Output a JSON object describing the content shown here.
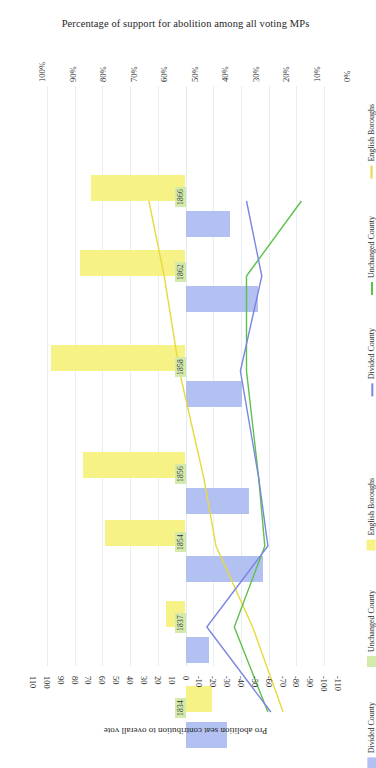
{
  "chart_data": {
    "type": "bar",
    "title": "Percentage of support for abolition among all voting MPs",
    "xlabel": "Pro abolition seat contribution to overall vote",
    "ylabel": "",
    "orientation": "rotated-90",
    "grid": true,
    "top_axis": {
      "label": "Percentage of support for abolition among all voting MPs",
      "ticks": [
        "100%",
        "90%",
        "80%",
        "70%",
        "60%",
        "50%",
        "40%",
        "30%",
        "20%",
        "10%",
        "0%"
      ],
      "range": [
        100,
        0
      ]
    },
    "bottom_axis": {
      "label": "Pro abolition seat contribution to overall vote",
      "ticks": [
        "110",
        "100",
        "90",
        "80",
        "70",
        "60",
        "50",
        "40",
        "30",
        "20",
        "10",
        "0",
        "-10",
        "-20",
        "-30",
        "-40",
        "-50",
        "-60",
        "-70",
        "-80",
        "-90",
        "-100",
        "-110"
      ],
      "range": [
        110,
        -110
      ]
    },
    "categories": [
      "1866",
      "1862",
      "1858",
      "1856",
      "1854",
      "1837",
      "1834"
    ],
    "bar_series": [
      {
        "name": "English Boroughs",
        "color": "#f6f285",
        "values": [
          68,
          76,
          97,
          74,
          58,
          14,
          -19
        ]
      },
      {
        "name": "Unchanged County",
        "color": "#d2ebab",
        "values": [
          5,
          4,
          3,
          6,
          7,
          9,
          2
        ]
      },
      {
        "name": "Divided County",
        "color": "#b2c0f2",
        "values": [
          -32,
          -52,
          -41,
          -46,
          -56,
          -17,
          -30
        ]
      }
    ],
    "line_series": [
      {
        "name": "English Boroughs",
        "color": "#e8d93f",
        "values": [
          62,
          57,
          52,
          44,
          40,
          28,
          18
        ]
      },
      {
        "name": "Unchanged County",
        "color": "#5cc14a",
        "values": [
          12,
          30,
          30,
          26,
          24,
          34,
          23
        ]
      },
      {
        "name": "Divided County",
        "color": "#7b86e0",
        "values": [
          30,
          25,
          32,
          26,
          23,
          43,
          22
        ]
      }
    ],
    "legend_position": "right",
    "legend_groups": [
      {
        "kind": "line",
        "entries": [
          {
            "label": "English Boroughs",
            "color": "#e8d93f"
          },
          {
            "label": "Unchanged County",
            "color": "#5cc14a"
          },
          {
            "label": "Divided County",
            "color": "#7b86e0"
          }
        ]
      },
      {
        "kind": "bar",
        "entries": [
          {
            "label": "English Boroughs",
            "color": "#f6f285"
          },
          {
            "label": "Unchanged County",
            "color": "#d2ebab"
          },
          {
            "label": "Divided County",
            "color": "#b2c0f2"
          }
        ]
      }
    ]
  }
}
